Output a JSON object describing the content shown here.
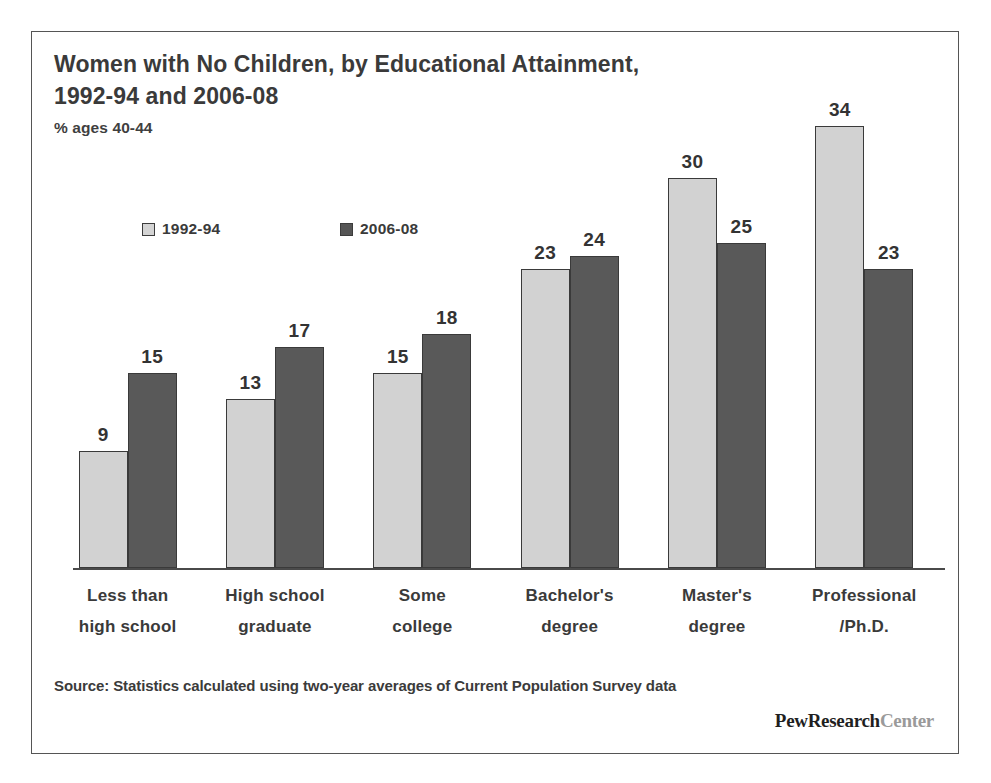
{
  "chart_data": {
    "type": "bar",
    "title": "Women with No Children, by Educational Attainment,\n1992-94 and 2006-08",
    "subtitle": "% ages 40-44",
    "xlabel": "",
    "ylabel": "",
    "ylim": [
      0,
      34
    ],
    "grid": false,
    "legend_position": "top-left",
    "categories": [
      "Less than\nhigh school",
      "High school\ngraduate",
      "Some\ncollege",
      "Bachelor's\ndegree",
      "Master's\ndegree",
      "Professional\n/Ph.D."
    ],
    "series": [
      {
        "name": "1992-94",
        "color": "#d2d2d2",
        "values": [
          9,
          13,
          15,
          23,
          30,
          34
        ]
      },
      {
        "name": "2006-08",
        "color": "#595959",
        "values": [
          15,
          17,
          18,
          24,
          25,
          23
        ]
      }
    ],
    "source": "Source: Statistics calculated using two-year averages of Current Population Survey data"
  },
  "logo": {
    "main": "PewResearch",
    "sub": "Center"
  }
}
